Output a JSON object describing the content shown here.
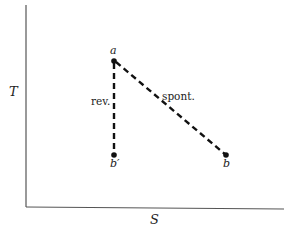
{
  "diagram": {
    "axes": {
      "y_label": "T",
      "x_label": "S"
    },
    "points": [
      {
        "id": "a",
        "label": "a",
        "x": 114,
        "y": 61
      },
      {
        "id": "b_prime",
        "label": "b′",
        "x": 114,
        "y": 155
      },
      {
        "id": "b",
        "label": "b",
        "x": 226,
        "y": 155
      }
    ],
    "paths": [
      {
        "from": "a",
        "to": "b_prime",
        "label": "rev.",
        "style": "dashed"
      },
      {
        "from": "a",
        "to": "b",
        "label": "spont.",
        "style": "dashed"
      }
    ],
    "colors": {
      "line": "#111111",
      "axis": "#555555",
      "text": "#222222"
    }
  }
}
